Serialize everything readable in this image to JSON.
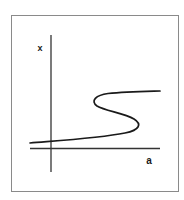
{
  "diagram": {
    "type": "bifurcation-s-curve",
    "axes": {
      "x_label": "a",
      "y_label": "x"
    },
    "colors": {
      "frame": "#8a8a8a",
      "axis": "#333333",
      "curve": "#1a1a1a"
    }
  }
}
